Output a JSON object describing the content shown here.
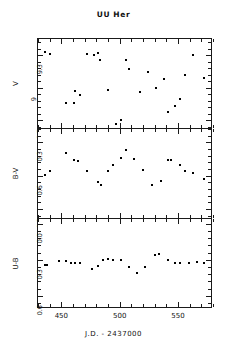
{
  "figure": {
    "title": "UU Her",
    "xaxis_title": "J.D.  -  2437000"
  },
  "chart_data": [
    {
      "type": "scatter",
      "title": "UU Her",
      "panel": "V",
      "ylabel": "V",
      "xlabel": "J.D. - 2437000",
      "xlim": [
        430,
        580
      ],
      "ylim": [
        9.45,
        8.62
      ],
      "yticks": [
        8.7,
        9.0,
        9.3
      ],
      "ytick_labels": [
        "8.7",
        "9",
        "9.3"
      ],
      "xticks": [
        450,
        500,
        550
      ],
      "xtick_labels": [
        "450",
        "500",
        "550"
      ],
      "y_inverted": true,
      "grid": false,
      "legend": "none",
      "x": [
        436,
        440,
        454,
        461,
        462,
        466,
        472,
        478,
        481,
        483,
        490,
        497,
        501,
        505,
        508,
        517,
        524,
        531,
        538,
        541,
        547,
        552,
        556,
        563,
        572
      ],
      "y": [
        9.33,
        9.31,
        8.86,
        8.86,
        8.97,
        8.93,
        9.31,
        9.3,
        9.32,
        9.26,
        8.98,
        8.67,
        8.7,
        9.26,
        9.17,
        8.96,
        9.15,
        9.0,
        9.08,
        8.78,
        8.83,
        8.9,
        9.12,
        9.3,
        9.09
      ]
    },
    {
      "type": "scatter",
      "panel": "B-V",
      "ylabel": "B-V",
      "xlabel": "J.D. - 2437000",
      "xlim": [
        430,
        580
      ],
      "ylim": [
        0.18,
        0.99
      ],
      "yticks": [
        0.3,
        0.6,
        0.9
      ],
      "ytick_labels": [
        "0.3",
        "0.6",
        "0.9"
      ],
      "xticks": [
        450,
        500,
        550
      ],
      "xtick_labels": [
        "450",
        "500",
        "550"
      ],
      "y_inverted": false,
      "grid": false,
      "legend": "none",
      "x": [
        436,
        440,
        454,
        461,
        464,
        472,
        481,
        484,
        490,
        494,
        501,
        505,
        512,
        520,
        528,
        535,
        541,
        544,
        552,
        556,
        563,
        572
      ],
      "y": [
        0.59,
        0.56,
        0.4,
        0.46,
        0.47,
        0.56,
        0.66,
        0.68,
        0.56,
        0.5,
        0.44,
        0.37,
        0.45,
        0.55,
        0.68,
        0.65,
        0.46,
        0.46,
        0.5,
        0.56,
        0.58,
        0.63
      ]
    },
    {
      "type": "scatter",
      "panel": "U-B",
      "ylabel": "U-B",
      "xlabel": "J.D. - 2437000",
      "xlim": [
        430,
        580
      ],
      "ylim": [
        -0.04,
        0.71
      ],
      "yticks": [
        0.0,
        0.3,
        0.6
      ],
      "ytick_labels": [
        "0.0",
        "0.3",
        "0.6"
      ],
      "xticks": [
        450,
        500,
        550
      ],
      "xtick_labels": [
        "450",
        "500",
        "550"
      ],
      "y_inverted": false,
      "grid": false,
      "legend": "none",
      "x": [
        436,
        438,
        448,
        454,
        458,
        462,
        466,
        476,
        481,
        486,
        490,
        494,
        501,
        508,
        515,
        522,
        530,
        534,
        541,
        547,
        552,
        559,
        566,
        572
      ],
      "y": [
        0.34,
        0.34,
        0.31,
        0.31,
        0.33,
        0.33,
        0.33,
        0.38,
        0.35,
        0.3,
        0.29,
        0.3,
        0.3,
        0.36,
        0.41,
        0.36,
        0.26,
        0.25,
        0.3,
        0.33,
        0.33,
        0.33,
        0.32,
        0.33
      ]
    }
  ]
}
